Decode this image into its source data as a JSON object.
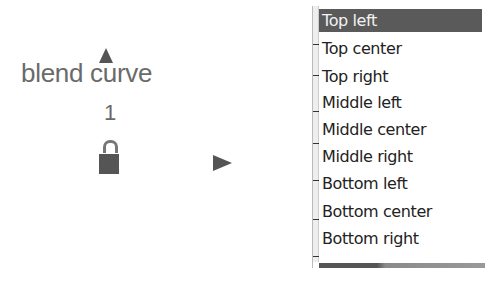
{
  "node": {
    "title": "blend curve",
    "value": "1",
    "icons": {
      "up": "up-arrow-icon",
      "lock": "unlocked-padlock-icon",
      "expand": "play-arrow-icon"
    }
  },
  "dropdown": {
    "selected": "Top left",
    "options": [
      {
        "label": "Top left"
      },
      {
        "label": "Top center"
      },
      {
        "label": "Top right"
      },
      {
        "label": "Middle left"
      },
      {
        "label": "Middle center"
      },
      {
        "label": "Middle right"
      },
      {
        "label": "Bottom left"
      },
      {
        "label": "Bottom center"
      },
      {
        "label": "Bottom right"
      }
    ],
    "colors": {
      "selected_bg": "#5a5a5a",
      "selected_text": "#f2f2f2",
      "text": "#222222"
    }
  }
}
